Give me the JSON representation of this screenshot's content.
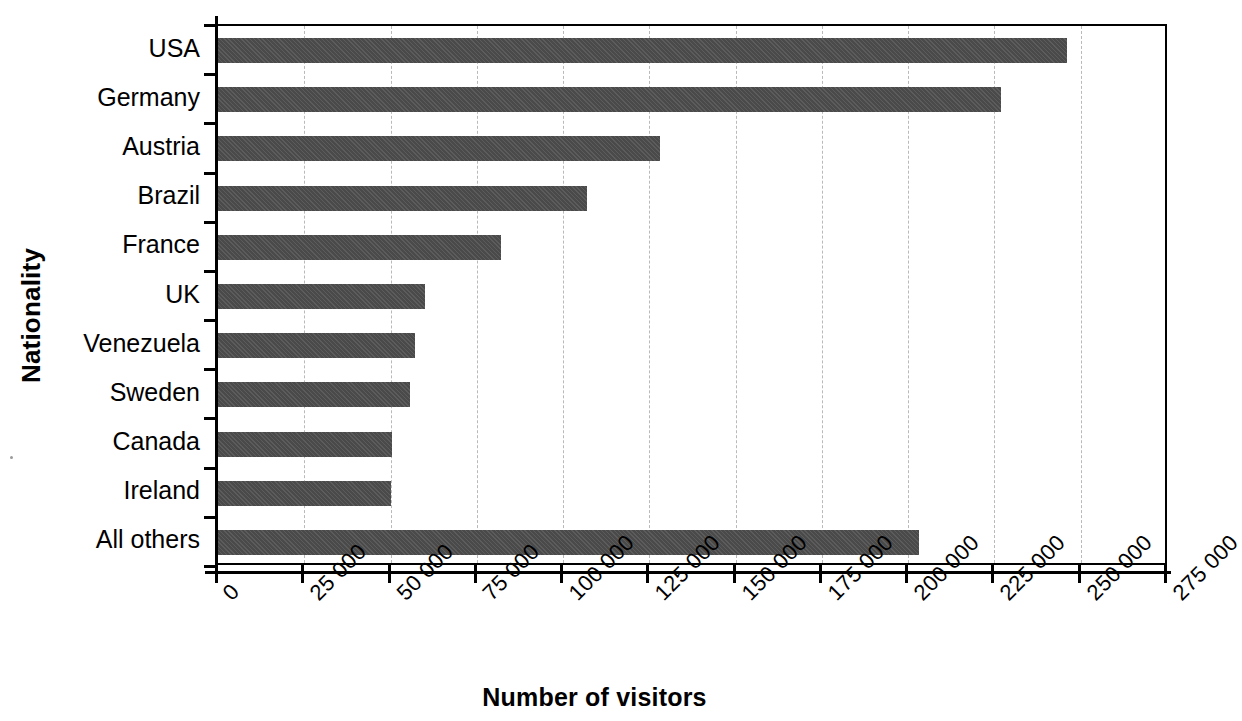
{
  "chart_data": {
    "type": "bar",
    "orientation": "horizontal",
    "title": "",
    "xlabel": "Number of visitors",
    "ylabel": "Nationality",
    "categories": [
      "USA",
      "Germany",
      "Austria",
      "Brazil",
      "France",
      "UK",
      "Venezuela",
      "Sweden",
      "Canada",
      "Ireland",
      "All others"
    ],
    "values": [
      246000,
      227000,
      128000,
      107000,
      82000,
      60000,
      57000,
      55500,
      50500,
      50000,
      203000
    ],
    "xlim": [
      0,
      275000
    ],
    "xtick_values": [
      0,
      25000,
      50000,
      75000,
      100000,
      125000,
      150000,
      175000,
      200000,
      225000,
      250000,
      275000
    ],
    "xtick_labels": [
      "0",
      "25 000",
      "50 000",
      "75 000",
      "100 000",
      "125 000",
      "150 000",
      "175 000",
      "200 000",
      "225 000",
      "250 000",
      "275 000"
    ],
    "grid": "vertical-dashed",
    "legend": "none",
    "bar_color": "#4a4a4a",
    "axis_color": "#000000",
    "grid_color": "#b9b9b9"
  },
  "axes": {
    "x_title": "Number of visitors",
    "y_title": "Nationality"
  }
}
